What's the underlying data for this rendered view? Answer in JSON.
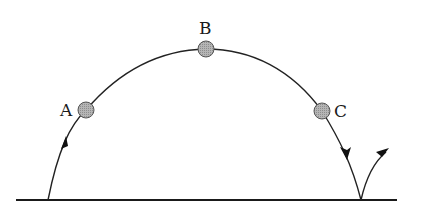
{
  "diagram": {
    "type": "projectile-trajectory",
    "points": [
      {
        "label": "A",
        "x": 86,
        "y": 110
      },
      {
        "label": "B",
        "x": 206,
        "y": 49
      },
      {
        "label": "C",
        "x": 322,
        "y": 111
      }
    ],
    "colors": {
      "ball_fill": "#a8a8a8",
      "line": "#222222",
      "background": "#ffffff"
    }
  }
}
